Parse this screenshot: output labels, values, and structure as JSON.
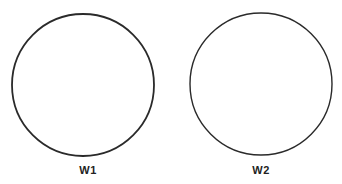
{
  "diagram": {
    "type": "labeled-circles",
    "stroke_color": "#2a2a2a",
    "background": "#ffffff",
    "circles": [
      {
        "label": "W1",
        "cx": 83,
        "cy": 85,
        "r": 71,
        "stroke_width": 1.8,
        "label_x": 68
      },
      {
        "label": "W2",
        "cx": 261,
        "cy": 84,
        "r": 71,
        "stroke_width": 1.4,
        "label_x": 241
      }
    ]
  }
}
